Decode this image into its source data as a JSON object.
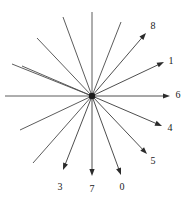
{
  "figure": {
    "type": "radial-vector-diagram",
    "width": 191,
    "height": 201,
    "background_color": "#ffffff",
    "line_color": "#4a4a4a",
    "arrow_color": "#2b2b2b",
    "label_color": "#1a1a1a",
    "center": {
      "x": 92,
      "y": 96
    },
    "hub_radius": 3.2
  },
  "chart_data": {
    "type": "scatter",
    "title": "",
    "xlabel": "",
    "ylabel": "",
    "grid": false,
    "legend": "none",
    "origin": {
      "x": 92,
      "y": 96
    },
    "vectors": [
      {
        "label": "0",
        "tip": {
          "x": 121,
          "y": 175
        },
        "label_pos": {
          "x": 122,
          "y": 187
        },
        "opposite_end": {
          "x": 63,
          "y": 17
        },
        "angle_deg": -69.9,
        "length": 84.2
      },
      {
        "label": "1",
        "tip": {
          "x": 164,
          "y": 62
        },
        "label_pos": {
          "x": 171,
          "y": 61
        },
        "opposite_end": {
          "x": 20,
          "y": 130
        },
        "angle_deg": 25.5,
        "length": 79.8
      },
      {
        "label": "3",
        "tip": {
          "x": 63,
          "y": 170
        },
        "label_pos": {
          "x": 60,
          "y": 187
        },
        "opposite_end": {
          "x": 121,
          "y": 22
        },
        "angle_deg": -112.0,
        "length": 78.4
      },
      {
        "label": "4",
        "tip": {
          "x": 162,
          "y": 126
        },
        "label_pos": {
          "x": 170,
          "y": 128
        },
        "opposite_end": {
          "x": 22,
          "y": 66
        },
        "angle_deg": -23.0,
        "length": 75.9
      },
      {
        "label": "5",
        "tip": {
          "x": 147,
          "y": 154
        },
        "label_pos": {
          "x": 153,
          "y": 161
        },
        "opposite_end": {
          "x": 37,
          "y": 38
        },
        "angle_deg": -46.6,
        "length": 79.9
      },
      {
        "label": "6",
        "tip": {
          "x": 170,
          "y": 96
        },
        "label_pos": {
          "x": 178,
          "y": 95
        },
        "opposite_end": {
          "x": 5,
          "y": 96
        },
        "angle_deg": 0.0,
        "length": 78.0
      },
      {
        "label": "7",
        "tip": {
          "x": 92,
          "y": 176
        },
        "label_pos": {
          "x": 92,
          "y": 189
        },
        "opposite_end": {
          "x": 92,
          "y": 12
        },
        "angle_deg": -90.0,
        "length": 80.0
      },
      {
        "label": "8",
        "tip": {
          "x": 146,
          "y": 33
        },
        "label_pos": {
          "x": 153,
          "y": 26
        },
        "opposite_end": {
          "x": 33,
          "y": 163
        },
        "angle_deg": 47.8,
        "length": 81.2
      },
      {
        "label": "1b",
        "hidden_label": true,
        "tip": {
          "x": 160,
          "y": 64
        },
        "label_pos": {
          "x": 0,
          "y": 0
        },
        "opposite_end": {
          "x": 12,
          "y": 64
        },
        "angle_deg": 22.0,
        "length": 70.0
      }
    ],
    "unlabeled_rays": [
      {
        "end": {
          "x": 12,
          "y": 64
        },
        "note": "upper-left shallow ray"
      },
      {
        "end": {
          "x": 32,
          "y": 33
        },
        "note": "upper-left mid ray"
      },
      {
        "end": {
          "x": 62,
          "y": 12
        },
        "note": "upper-left steep ray"
      },
      {
        "end": {
          "x": 12,
          "y": 128
        },
        "note": "lower-left shallow ray"
      },
      {
        "end": {
          "x": 33,
          "y": 163
        },
        "note": "lower-left steep ray"
      }
    ],
    "labels": [
      "0",
      "1",
      "3",
      "4",
      "5",
      "6",
      "7",
      "8"
    ],
    "label_count": 8
  }
}
